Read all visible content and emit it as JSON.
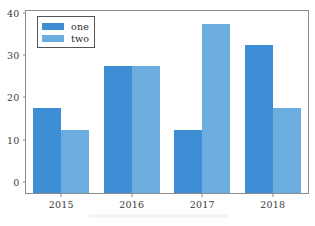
{
  "chart_data": {
    "type": "bar",
    "title": "",
    "subtitle": "",
    "xlabel": "",
    "ylabel": "",
    "categories": [
      "2015",
      "2016",
      "2017",
      "2018"
    ],
    "series": [
      {
        "name": "one",
        "values": [
          20,
          30,
          15,
          35
        ],
        "color": "#3d8ed4"
      },
      {
        "name": "two",
        "values": [
          15,
          30,
          40,
          20
        ],
        "color": "#6badde"
      }
    ],
    "ylim": [
      0,
      43
    ],
    "yticks": [
      0,
      10,
      20,
      30,
      40
    ],
    "ytick_labels": [
      "0",
      "10",
      "20",
      "30",
      "40"
    ],
    "grid": false,
    "legend_position": "upper left",
    "frame": true,
    "bar_group_width": 0.8
  },
  "legend": {
    "entries": [
      {
        "label": "one",
        "color": "#3d8ed4"
      },
      {
        "label": "two",
        "color": "#6badde"
      }
    ]
  },
  "axes": {
    "x_tick_labels": [
      "2015",
      "2016",
      "2017",
      "2018"
    ],
    "y_tick_labels": [
      "0",
      "10",
      "20",
      "30",
      "40"
    ]
  },
  "colors": {
    "series_one": "#3d8ed4",
    "series_two": "#6badde",
    "axis": "#8c8c8c",
    "tick_text": "#3a3a3a",
    "background": "#ffffff"
  }
}
